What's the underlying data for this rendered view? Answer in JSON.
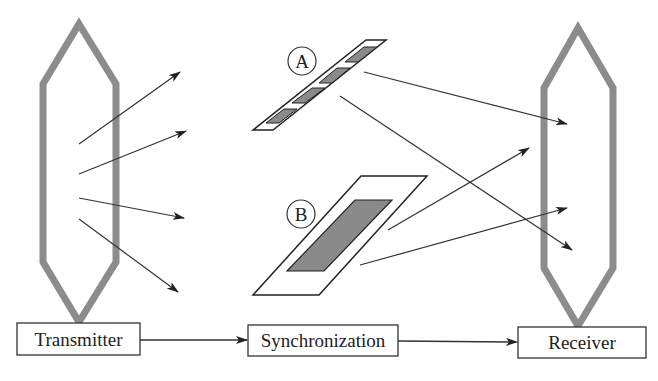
{
  "diagram": {
    "boxes": {
      "transmitter": "Transmitter",
      "synchronization": "Synchronization",
      "receiver": "Receiver"
    },
    "surfaces": {
      "a_label": "A",
      "b_label": "B"
    },
    "colors": {
      "antenna": "#8c8c8c",
      "line": "#333333",
      "patch_fill": "#8a8a8a",
      "background": "#ffffff"
    }
  }
}
